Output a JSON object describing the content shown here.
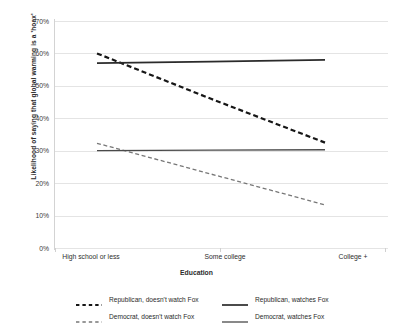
{
  "chart_data": {
    "type": "line",
    "title": "",
    "subtitle": "",
    "xlabel": "Education",
    "ylabel": "Likelihood of saying that global warming is a 'hoax'",
    "categories": [
      "High school or less",
      "Some college",
      "College +"
    ],
    "ylim": [
      0,
      70
    ],
    "ytick_labels": [
      "0%",
      "10%",
      "20%",
      "30%",
      "40%",
      "50%",
      "60%",
      "70%"
    ],
    "ytick_values": [
      0,
      10,
      20,
      30,
      40,
      50,
      60,
      70
    ],
    "grid": true,
    "legend_position": "bottom",
    "series": [
      {
        "name": "Republican, doesn't watch Fox",
        "values": [
          60,
          46,
          32.5
        ],
        "style": "dashed",
        "color": "#161616",
        "width": 2.2
      },
      {
        "name": "Republican, watches Fox",
        "values": [
          57,
          57.5,
          58
        ],
        "style": "solid",
        "color": "#2b2b2b",
        "width": 1.7
      },
      {
        "name": "Democrat, doesn't watch Fox",
        "values": [
          32.3,
          22.8,
          13.3
        ],
        "style": "dashed",
        "color": "#777777",
        "width": 1.3
      },
      {
        "name": "Democrat, watches Fox",
        "values": [
          30,
          30.2,
          30.3
        ],
        "style": "solid",
        "color": "#4a4a4a",
        "width": 1.3
      }
    ]
  },
  "legend": {
    "items": [
      {
        "label": "Republican, doesn't watch Fox"
      },
      {
        "label": "Republican, watches Fox"
      },
      {
        "label": "Democrat, doesn't watch Fox"
      },
      {
        "label": "Democrat, watches Fox"
      }
    ]
  }
}
